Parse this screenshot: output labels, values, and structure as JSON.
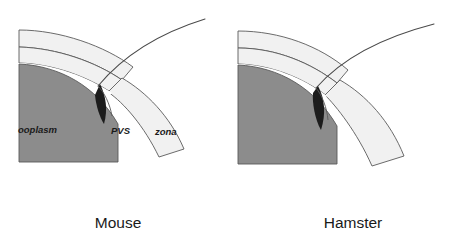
{
  "figure": {
    "width": 476,
    "height": 241,
    "background_color": "#ffffff"
  },
  "colors": {
    "background": "#ffffff",
    "ooplasm_fill": "#8c8c8c",
    "zona_fill": "#f1f1f1",
    "pvs_fill": "#ffffff",
    "sperm_head_fill": "#1c1c1c",
    "outline_stroke": "#5a5a5a",
    "tail_stroke": "#4a4a4a",
    "label_text": "#1a1a1a"
  },
  "panels": [
    {
      "id": "mouse",
      "caption": "Mouse",
      "caption_x": 118,
      "caption_y": 228,
      "region_labels": [
        {
          "id": "ooplasm",
          "text": "ooplasm",
          "x": 18,
          "y": 133
        },
        {
          "id": "pvs",
          "text": "PVS",
          "x": 111,
          "y": 134
        },
        {
          "id": "zona",
          "text": "zona",
          "x": 155,
          "y": 135
        }
      ],
      "structures": {
        "zona_outer_band": "M 19,30 C 60,30 105,46 133,67 L 122,80 C 96,62 57,48 19,47 Z",
        "zona_inner_band": "M 19,47 C 57,48 96,62 122,80 L 112,93 C 88,77 54,64 19,63 Z",
        "ooplasm_wedge": "M 19,64 C 60,66 96,86 118,124 L 118,162 L 19,162 Z",
        "sperm_head": "M 100,84 C 106,96 108,110 104,124 C 100,118 96,106 95,95 Z",
        "sperm_tail": "M 98,86 C 118,62 150,36 205,19"
      }
    },
    {
      "id": "hamster",
      "caption": "Hamster",
      "caption_x": 353,
      "caption_y": 228,
      "region_labels": [],
      "structures": {
        "zona_outer_band": "M 238,31 C 280,31 320,46 348,70 L 337,83 C 311,63 276,48 238,48 Z",
        "zona_inner_band": "M 238,48 C 276,48 311,63 337,83 L 327,96 C 303,78 272,65 238,64 Z",
        "ooplasm_wedge": "M 238,65 C 279,67 315,88 337,126 L 337,164 L 238,164 Z",
        "sperm_head": "M 318,86 C 325,99 326,114 321,130 C 315,120 312,102 313,93 Z",
        "sperm_tail": "M 316,88 C 337,64 372,40 434,24"
      }
    }
  ]
}
